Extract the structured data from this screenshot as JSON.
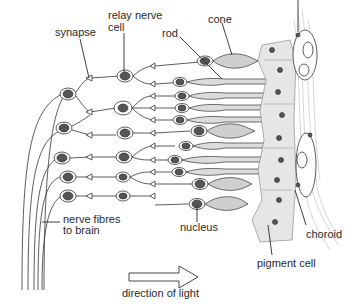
{
  "diagram": {
    "labels": {
      "synapse": "synapse",
      "relay_line1": "relay nerve",
      "relay_line2": "cell",
      "rod": "rod",
      "cone": "cone",
      "nerve_line1": "nerve fibres",
      "nerve_line2": "to brain",
      "nucleus": "nucleus",
      "choroid": "choroid",
      "pigment": "pigment cell",
      "direction": "direction of light"
    },
    "colors": {
      "ink": "#2a2a2a",
      "cell_fill": "#d4d4d4",
      "pigment_fill": "#e6e6e6",
      "background": "#ffffff"
    }
  }
}
